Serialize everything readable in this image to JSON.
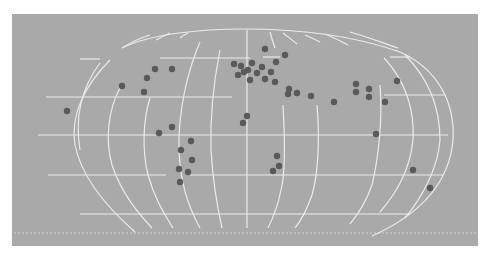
{
  "map": {
    "background_color": "#ffffff",
    "panel_color": "#a9a9a9",
    "grid_color": "#f2f2f2",
    "marker_color": "#5a5a5a",
    "panel": {
      "x": 12,
      "y": 14,
      "width": 222,
      "height": 110,
      "comment_units": "half-scale"
    },
    "projection": "pseudo-cylindrical world grid (graticule only)",
    "markers": [
      {
        "x": 67,
        "y": 111
      },
      {
        "x": 122,
        "y": 86
      },
      {
        "x": 147,
        "y": 78
      },
      {
        "x": 155,
        "y": 69
      },
      {
        "x": 172,
        "y": 69
      },
      {
        "x": 144,
        "y": 92
      },
      {
        "x": 159,
        "y": 133
      },
      {
        "x": 172,
        "y": 127
      },
      {
        "x": 191,
        "y": 141
      },
      {
        "x": 181,
        "y": 150
      },
      {
        "x": 192,
        "y": 160
      },
      {
        "x": 179,
        "y": 169
      },
      {
        "x": 188,
        "y": 172
      },
      {
        "x": 180,
        "y": 182
      },
      {
        "x": 234,
        "y": 64
      },
      {
        "x": 241,
        "y": 66
      },
      {
        "x": 265,
        "y": 49
      },
      {
        "x": 285,
        "y": 55
      },
      {
        "x": 276,
        "y": 62
      },
      {
        "x": 252,
        "y": 63
      },
      {
        "x": 262,
        "y": 67
      },
      {
        "x": 248,
        "y": 70
      },
      {
        "x": 271,
        "y": 72
      },
      {
        "x": 257,
        "y": 73
      },
      {
        "x": 238,
        "y": 75
      },
      {
        "x": 265,
        "y": 79
      },
      {
        "x": 250,
        "y": 80
      },
      {
        "x": 275,
        "y": 82
      },
      {
        "x": 244,
        "y": 72
      },
      {
        "x": 289,
        "y": 89
      },
      {
        "x": 288,
        "y": 94
      },
      {
        "x": 297,
        "y": 93
      },
      {
        "x": 311,
        "y": 96
      },
      {
        "x": 334,
        "y": 102
      },
      {
        "x": 356,
        "y": 84
      },
      {
        "x": 356,
        "y": 92
      },
      {
        "x": 369,
        "y": 89
      },
      {
        "x": 369,
        "y": 97
      },
      {
        "x": 385,
        "y": 102
      },
      {
        "x": 397,
        "y": 81
      },
      {
        "x": 376,
        "y": 134
      },
      {
        "x": 247,
        "y": 116
      },
      {
        "x": 243,
        "y": 123
      },
      {
        "x": 277,
        "y": 156
      },
      {
        "x": 279,
        "y": 166
      },
      {
        "x": 273,
        "y": 171
      },
      {
        "x": 413,
        "y": 170
      },
      {
        "x": 430,
        "y": 188
      }
    ]
  }
}
